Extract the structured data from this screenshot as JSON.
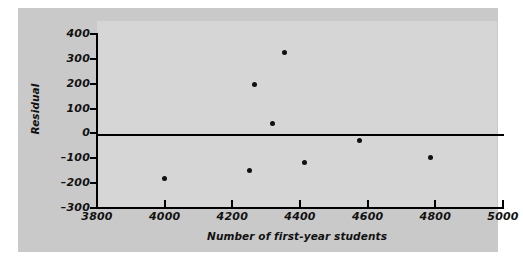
{
  "chart_data": {
    "type": "scatter",
    "title": "",
    "xlabel": "Number of first-year students",
    "ylabel": "Residual",
    "xlim": [
      3800,
      5000
    ],
    "ylim": [
      -300,
      400
    ],
    "xticks": [
      3800,
      4000,
      4200,
      4400,
      4600,
      4800,
      5000
    ],
    "yticks": [
      400,
      300,
      200,
      100,
      0,
      -100,
      -200,
      -300
    ],
    "grid": false,
    "legend": null,
    "reference_lines": [
      {
        "name": "zero-residual-line",
        "orientation": "horizontal",
        "value": 0
      }
    ],
    "points": [
      {
        "x": 4000,
        "y": -180
      },
      {
        "x": 4250,
        "y": -150
      },
      {
        "x": 4265,
        "y": 195
      },
      {
        "x": 4318,
        "y": 40
      },
      {
        "x": 4353,
        "y": 325
      },
      {
        "x": 4412,
        "y": -118
      },
      {
        "x": 4575,
        "y": -28
      },
      {
        "x": 4785,
        "y": -98
      }
    ],
    "marker": "filled-circle",
    "marker_color": "#111111"
  },
  "colors": {
    "panel_background": "#c9c9c9",
    "plot_background": "#d6d6d6",
    "axis": "#111111",
    "page_background": "#ffffff"
  }
}
